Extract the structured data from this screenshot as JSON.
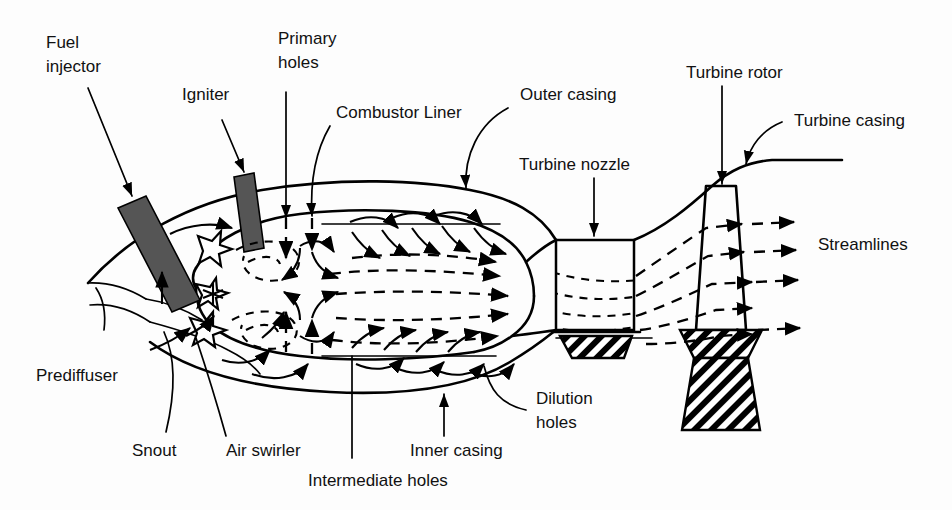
{
  "figure": {
    "width": 952,
    "height": 510,
    "background_color": "#fdfdfd",
    "line_color": "#000000",
    "injector_fill_color": "#555555",
    "text_color": "#111111"
  },
  "labels": {
    "fuel_injector_line1": "Fuel",
    "fuel_injector_line2": "injector",
    "igniter": "Igniter",
    "primary_holes_line1": "Primary",
    "primary_holes_line2": "holes",
    "combustor_liner": "Combustor Liner",
    "outer_casing": "Outer casing",
    "turbine_nozzle": "Turbine nozzle",
    "turbine_rotor": "Turbine rotor",
    "turbine_casing": "Turbine casing",
    "streamlines": "Streamlines",
    "prediffuser": "Prediffuser",
    "snout": "Snout",
    "air_swirler": "Air swirler",
    "intermediate_holes": "Intermediate holes",
    "inner_casing": "Inner casing",
    "dilution_holes_line1": "Dilution",
    "dilution_holes_line2": "holes"
  },
  "components": [
    {
      "name": "fuel-injector",
      "label": "Fuel injector",
      "type": "filled-bar"
    },
    {
      "name": "igniter",
      "label": "Igniter",
      "type": "filled-bar"
    },
    {
      "name": "primary-holes",
      "label": "Primary holes",
      "type": "jet-holes"
    },
    {
      "name": "intermediate-holes",
      "label": "Intermediate holes",
      "type": "jet-holes"
    },
    {
      "name": "dilution-holes",
      "label": "Dilution holes",
      "type": "jet-holes"
    },
    {
      "name": "combustor-liner",
      "label": "Combustor Liner",
      "type": "outline"
    },
    {
      "name": "outer-casing",
      "label": "Outer casing",
      "type": "outline"
    },
    {
      "name": "inner-casing",
      "label": "Inner casing",
      "type": "outline"
    },
    {
      "name": "prediffuser",
      "label": "Prediffuser",
      "type": "outline"
    },
    {
      "name": "snout",
      "label": "Snout",
      "type": "outline"
    },
    {
      "name": "air-swirler",
      "label": "Air swirler",
      "type": "swirler"
    },
    {
      "name": "turbine-nozzle",
      "label": "Turbine nozzle",
      "type": "box"
    },
    {
      "name": "turbine-rotor",
      "label": "Turbine rotor",
      "type": "hatched-blade"
    },
    {
      "name": "turbine-casing",
      "label": "Turbine casing",
      "type": "outline"
    },
    {
      "name": "streamlines",
      "label": "Streamlines",
      "type": "dashed-arrow"
    }
  ]
}
